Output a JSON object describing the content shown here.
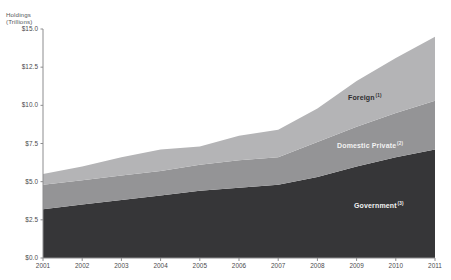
{
  "chart_data": {
    "type": "area",
    "stacked": true,
    "title": "",
    "subtitle": "",
    "xlabel": "",
    "ylabel": "Holdings (Trillions)",
    "ylabel_lines": [
      "Holdings",
      "(Trillions)"
    ],
    "grid": false,
    "legend_position": "inline-labels",
    "xlim": [
      2001,
      2011
    ],
    "ylim": [
      0.0,
      15.0
    ],
    "categories": [
      2001,
      2002,
      2003,
      2004,
      2005,
      2006,
      2007,
      2008,
      2009,
      2010,
      2011
    ],
    "x_tick_labels": [
      "2001",
      "2002",
      "2003",
      "2004",
      "2005",
      "2006",
      "2007",
      "2008",
      "2009",
      "2010",
      "2011"
    ],
    "y_tick_values": [
      0.0,
      2.5,
      5.0,
      7.5,
      10.0,
      12.5,
      15.0
    ],
    "y_tick_labels": [
      "$0.0",
      "$2.5",
      "$5.0",
      "$7.5",
      "$10.0",
      "$12.5",
      "$15.0"
    ],
    "series": [
      {
        "name": "Government",
        "footnote": "3",
        "color": "#363638",
        "label_color": "#f2f2f2",
        "values": [
          3.2,
          3.5,
          3.8,
          4.1,
          4.4,
          4.6,
          4.8,
          5.3,
          6.0,
          6.6,
          7.1
        ]
      },
      {
        "name": "Domestic Private",
        "footnote": "2",
        "color": "#949496",
        "label_color": "#f2f2f2",
        "values": [
          1.6,
          1.6,
          1.6,
          1.6,
          1.7,
          1.8,
          1.8,
          2.3,
          2.6,
          2.9,
          3.2
        ]
      },
      {
        "name": "Foreign",
        "footnote": "1",
        "color": "#b4b4b6",
        "label_color": "#2d2d2f",
        "values": [
          0.7,
          0.9,
          1.2,
          1.4,
          1.2,
          1.6,
          1.8,
          2.2,
          3.0,
          3.6,
          4.2
        ]
      }
    ],
    "series_totals": [
      5.5,
      6.0,
      6.6,
      7.1,
      7.3,
      8.0,
      8.4,
      9.8,
      11.6,
      13.1,
      14.5
    ],
    "annotations": [
      {
        "name": "Foreign",
        "footnote": "1",
        "x_px": 348,
        "y_px": 94
      },
      {
        "name": "Domestic Private",
        "footnote": "2",
        "x_px": 337,
        "y_px": 142
      },
      {
        "name": "Government",
        "footnote": "3",
        "x_px": 354,
        "y_px": 202
      }
    ],
    "axis_color": "#8c8c8e",
    "background": "#ffffff"
  }
}
